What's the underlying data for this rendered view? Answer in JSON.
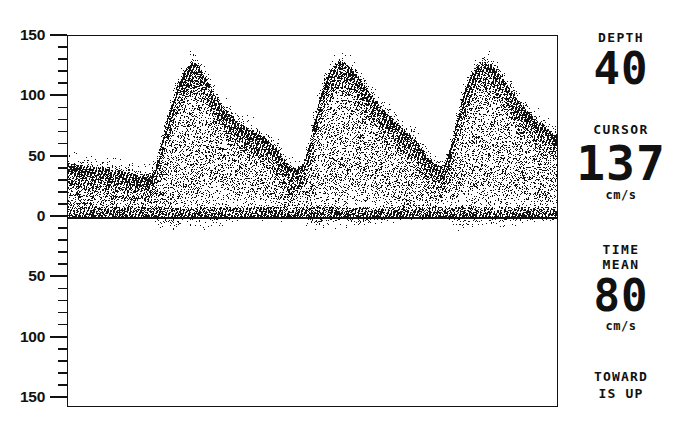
{
  "device": {
    "display_type": "spectral-doppler-waveform",
    "ink_color": "#111111",
    "background_color": "#ffffff"
  },
  "y_axis": {
    "labels": [
      "150",
      "100",
      "50",
      "0",
      "50",
      "100",
      "150"
    ],
    "major_values": [
      150,
      100,
      50,
      0,
      -50,
      -100,
      -150
    ],
    "minor_tick_step": 10,
    "unit": "cm/s"
  },
  "readout": {
    "depth": {
      "label": "DEPTH",
      "value": "40"
    },
    "cursor": {
      "label": "CURSOR",
      "value": "137",
      "unit": "cm/s"
    },
    "time_mean": {
      "label_line1": "TIME",
      "label_line2": "MEAN",
      "value": "80",
      "unit": "cm/s"
    },
    "orientation": {
      "line1": "TOWARD",
      "line2": "IS UP"
    }
  },
  "chart_data": {
    "type": "line",
    "title": "",
    "xlabel": "",
    "ylabel": "",
    "ylim": [
      -150,
      150
    ],
    "grid": false,
    "legend": null,
    "axis_labels_unsigned": true,
    "baseline_value": 0,
    "peak_systolic_velocity": 128,
    "time_mean_velocity": 80,
    "cursor_velocity": 137,
    "cycle_count": 3,
    "cycle_peaks_x_px": [
      145,
      295,
      465
    ],
    "envelope_note": "Three cardiac cycles: sharp systolic upstroke to ~125-130 cm/s, rapid early decay, slow diastolic runoff to ~30-40 cm/s, small negative spillover below baseline at each upstroke.",
    "series": [
      {
        "name": "peak envelope",
        "x": [
          0,
          10,
          20,
          30,
          40,
          50,
          60,
          70,
          78,
          82,
          86,
          90,
          95,
          100,
          106,
          112,
          120,
          128,
          136,
          144,
          150,
          156,
          162,
          170,
          178,
          186,
          196,
          206,
          216,
          226,
          236,
          244,
          250,
          255,
          258,
          262,
          266,
          270,
          275,
          280,
          286,
          292,
          298,
          305,
          312,
          320,
          330,
          340,
          350,
          360,
          370,
          380,
          390,
          398,
          406,
          414,
          420,
          425,
          430,
          435,
          440,
          446,
          452,
          458,
          465,
          472,
          480,
          488,
          496,
          506,
          516,
          526,
          536,
          546,
          556,
          566,
          576,
          586,
          596
        ],
        "y": [
          44,
          43,
          42,
          41,
          40,
          39,
          38,
          37,
          36,
          35,
          34,
          33,
          33,
          34,
          40,
          58,
          80,
          100,
          115,
          124,
          128,
          126,
          120,
          110,
          100,
          92,
          84,
          78,
          74,
          70,
          66,
          62,
          58,
          54,
          50,
          46,
          42,
          40,
          40,
          41,
          44,
          58,
          78,
          98,
          114,
          123,
          128,
          125,
          118,
          108,
          98,
          90,
          83,
          78,
          73,
          68,
          64,
          60,
          55,
          50,
          46,
          43,
          42,
          44,
          60,
          82,
          102,
          116,
          125,
          128,
          124,
          116,
          106,
          96,
          88,
          81,
          75,
          70,
          66
        ]
      },
      {
        "name": "spectral window lower edge",
        "x": [
          0,
          40,
          80,
          110,
          130,
          150,
          180,
          210,
          240,
          262,
          290,
          310,
          330,
          360,
          390,
          414,
          440,
          462,
          480,
          510,
          540,
          570,
          596
        ],
        "y": [
          6,
          5,
          5,
          6,
          14,
          26,
          30,
          28,
          22,
          8,
          12,
          26,
          30,
          28,
          22,
          8,
          10,
          24,
          30,
          28,
          24,
          18,
          14
        ]
      }
    ]
  }
}
